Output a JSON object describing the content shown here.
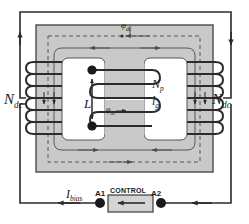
{
  "diagram": {
    "colors": {
      "core_fill": "#c9c9c9",
      "core_stroke": "#3a3a3a",
      "wire": "#2b2b2b",
      "flux_dashed": "#4a4a4a",
      "window_fill": "#ffffff",
      "control_box_fill": "#d4d4d4",
      "background": "#ffffff"
    },
    "labels": {
      "ndc_left": "N",
      "ndc_left_sub": "dc",
      "ndc_right": "N",
      "ndc_right_sub": "dc",
      "inductor": "L",
      "primary_turns": "N",
      "primary_turns_sub": "p",
      "gap_length": "l",
      "gap_length_sub": "g",
      "flux_dc": "φ",
      "flux_dc_sub": "dc",
      "flux_ac": "φ",
      "flux_ac_sub": "ac",
      "bias_current": "I",
      "bias_current_sub": "bias",
      "terminal_a1": "A1",
      "terminal_a2": "A2",
      "control_block": "CONTROL"
    },
    "elements": {
      "core": "E-shaped gray magnetic core",
      "left_winding": "dc bias winding on left leg",
      "right_winding": "dc bias winding on right leg",
      "center_winding": "ac primary winding on center leg",
      "terminal_dot_top": "primary terminal top",
      "terminal_dot_bottom": "primary terminal bottom",
      "control_arrow": "left-pointing current direction arrow",
      "outer_loop": "dc bias current loop"
    }
  }
}
